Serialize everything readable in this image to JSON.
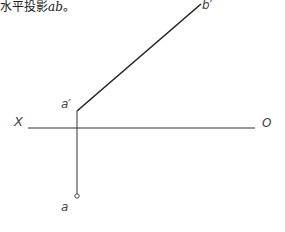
{
  "caption": {
    "text": "水平投影",
    "term": "ab",
    "end": "。"
  },
  "diagram": {
    "axis": {
      "left_label": "X",
      "right_label": "O"
    },
    "points": {
      "a_prime": "a′",
      "b_prime": "b′",
      "a": "a"
    },
    "colors": {
      "line": "#333333",
      "label": "#444444"
    }
  }
}
